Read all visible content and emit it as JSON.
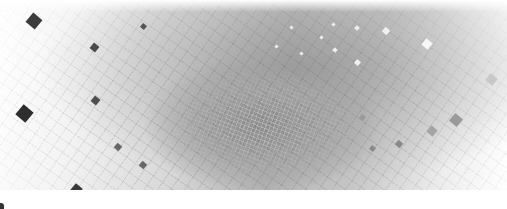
{
  "image": {
    "description": "Abstract grayscale vortex of square tiles spiraling into a central point",
    "colors": {
      "background": "#ffffff",
      "center": "#8e8e8e",
      "dark_tile": "#3a3a3a",
      "mid_tile": "#8a8a8a",
      "light_tile": "#f4f4f4"
    }
  }
}
